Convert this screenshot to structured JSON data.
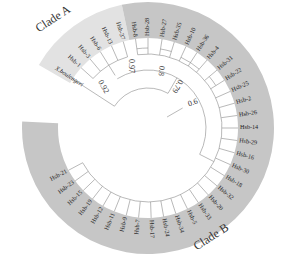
{
  "figure": {
    "type": "circular phylogenetic tree",
    "center": [
      148,
      128
    ],
    "band_inner_radius": 90,
    "band_outer_radius": 126,
    "colors": {
      "clade_a_band": "#e2e2e2",
      "clade_b_band": "#c6c6c6",
      "branch": "#8a8a8a",
      "text": "#222222"
    }
  },
  "clades": [
    {
      "name": "Clade A",
      "label_pos": [
        55,
        22
      ],
      "label_rotate": -33,
      "start_deg": 210,
      "end_deg": 258
    },
    {
      "name": "Clade B",
      "label_pos": [
        213,
        240
      ],
      "label_rotate": -33,
      "start_deg": 258,
      "end_deg": 543
    }
  ],
  "outgroup": {
    "label": "X.boulengeri",
    "angle": 213
  },
  "taxa": [
    {
      "label": "Hsb-1",
      "angle": 222
    },
    {
      "label": "Hsb-3",
      "angle": 230
    },
    {
      "label": "Hsb-6",
      "angle": 238
    },
    {
      "label": "Hsb-13",
      "angle": 246
    },
    {
      "label": "Hsb-37",
      "angle": 254
    },
    {
      "label": "Hsb-8",
      "angle": 262
    },
    {
      "label": "Hsb-28",
      "angle": 270
    },
    {
      "label": "Hsb-27",
      "angle": 279
    },
    {
      "label": "Hsb-35",
      "angle": 287
    },
    {
      "label": "Hsb-10",
      "angle": 295
    },
    {
      "label": "Hsb-36",
      "angle": 303
    },
    {
      "label": "Hsb-4",
      "angle": 311
    },
    {
      "label": "Hsb-31",
      "angle": 320
    },
    {
      "label": "Hsb-22",
      "angle": 328
    },
    {
      "label": "Hsb-25",
      "angle": 336
    },
    {
      "label": "Hsb-2",
      "angle": 344
    },
    {
      "label": "Hsb-26",
      "angle": 352
    },
    {
      "label": "Hsb-14",
      "angle": 360
    },
    {
      "label": "Hsb-29",
      "angle": 368
    },
    {
      "label": "Hsb-16",
      "angle": 376
    },
    {
      "label": "Hsb-30",
      "angle": 384
    },
    {
      "label": "Hsb-18",
      "angle": 392
    },
    {
      "label": "Hsb-32",
      "angle": 400
    },
    {
      "label": "Hsb-20",
      "angle": 408
    },
    {
      "label": "Hsb-33",
      "angle": 416
    },
    {
      "label": "Hsb-5",
      "angle": 424
    },
    {
      "label": "Hsb-34",
      "angle": 432
    },
    {
      "label": "Hsb-24",
      "angle": 440
    },
    {
      "label": "Hsb-17",
      "angle": 448
    },
    {
      "label": "Hsb-7",
      "angle": 456
    },
    {
      "label": "Hsb-9",
      "angle": 464
    },
    {
      "label": "Hsb-11",
      "angle": 472
    },
    {
      "label": "Hsb-12",
      "angle": 480
    },
    {
      "label": "Hsb-19",
      "angle": 488
    },
    {
      "label": "Hsb-15",
      "angle": 496
    },
    {
      "label": "Hsb-23",
      "angle": 504
    },
    {
      "label": "Hsb-21",
      "angle": 512
    }
  ],
  "bootstrap": [
    {
      "value": "0.92",
      "pos": [
        103,
        87
      ],
      "rotate": 60
    },
    {
      "value": "0.97",
      "pos": [
        131,
        66
      ],
      "rotate": 90
    },
    {
      "value": "0.8",
      "pos": [
        161,
        71
      ],
      "rotate": 95
    },
    {
      "value": "0.79",
      "pos": [
        177,
        86
      ],
      "rotate": 120
    },
    {
      "value": "0.6",
      "pos": [
        193,
        103
      ],
      "rotate": -20
    }
  ]
}
